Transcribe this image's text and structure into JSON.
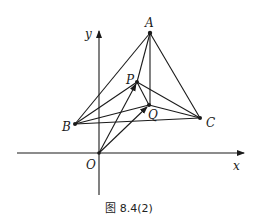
{
  "figure": {
    "caption": "图 8.4(2)",
    "axes": {
      "x_label": "x",
      "y_label": "y",
      "origin_label": "O"
    },
    "points": {
      "A": {
        "label": "A",
        "x": 150,
        "y": 33
      },
      "P": {
        "label": "P",
        "x": 137,
        "y": 82
      },
      "Q": {
        "label": "Q",
        "x": 149,
        "y": 105
      },
      "B": {
        "label": "B",
        "x": 75,
        "y": 124
      },
      "C": {
        "label": "C",
        "x": 200,
        "y": 118
      },
      "O": {
        "label": "O",
        "x": 99,
        "y": 153
      }
    },
    "segments": [
      [
        "A",
        "B"
      ],
      [
        "A",
        "C"
      ],
      [
        "B",
        "C"
      ],
      [
        "A",
        "P"
      ],
      [
        "A",
        "Q"
      ],
      [
        "P",
        "B"
      ],
      [
        "P",
        "C"
      ],
      [
        "Q",
        "B"
      ],
      [
        "Q",
        "C"
      ],
      [
        "P",
        "Q"
      ]
    ],
    "vectors": [
      [
        "O",
        "P"
      ],
      [
        "O",
        "Q"
      ]
    ],
    "colors": {
      "ink": "#1a1a1a",
      "background": "#ffffff"
    }
  }
}
